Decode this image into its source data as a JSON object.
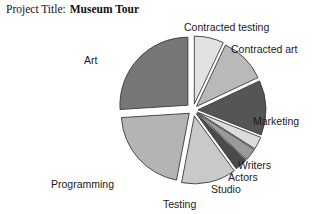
{
  "header": {
    "title_label": "Project Title:",
    "title_value": "Museum Tour"
  },
  "chart_data": {
    "type": "pie",
    "title": "Museum Tour",
    "xlabel": "",
    "ylabel": "",
    "grid": false,
    "legend_position": "none",
    "exploded": true,
    "start_angle_deg": -90,
    "direction": "clockwise",
    "center": {
      "x": 193,
      "y": 110
    },
    "radius": 68,
    "labels": [
      "Contracted testing",
      "Contracted art",
      "Marketing",
      "Writers",
      "Actors",
      "Studio",
      "Testing",
      "Programming",
      "Art"
    ],
    "values": [
      7,
      11,
      13,
      3,
      3,
      3,
      13,
      21,
      26
    ],
    "colors": [
      "#e2e2e2",
      "#b9b9b9",
      "#555555",
      "#dcdcdc",
      "#9a9a9a",
      "#4a4a4a",
      "#c9c9c9",
      "#b4b4b4",
      "#767676"
    ],
    "slice_edge_color": "#3a3a3a",
    "background": "#ffffff"
  }
}
